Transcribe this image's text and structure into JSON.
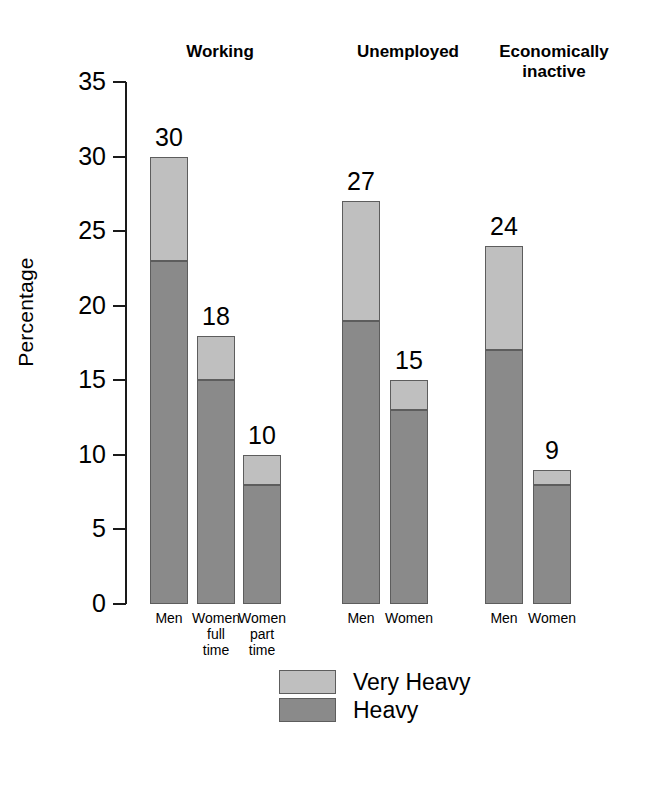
{
  "chart_data": {
    "type": "bar",
    "subtype": "stacked-bar-grouped",
    "title": "",
    "xlabel": "",
    "ylabel": "Percentage",
    "ylim": [
      0,
      35
    ],
    "yticks": [
      0,
      5,
      10,
      15,
      20,
      25,
      30,
      35
    ],
    "ytick_labels": [
      "0",
      "5",
      "10",
      "15",
      "20",
      "25",
      "30",
      "35"
    ],
    "grid": false,
    "legend_position": "bottom-center",
    "legend": [
      "Very Heavy",
      "Heavy"
    ],
    "series": [
      {
        "name": "Heavy",
        "color": "#8a8a8a",
        "values": [
          23,
          15,
          8,
          19,
          13,
          17,
          8
        ]
      },
      {
        "name": "Very Heavy",
        "color": "#bfbfbf",
        "values": [
          7,
          3,
          2,
          8,
          2,
          7,
          1
        ]
      }
    ],
    "categories": [
      "Men",
      "Women full time",
      "Women part time",
      "Men",
      "Women",
      "Men",
      "Women"
    ],
    "totals": [
      30,
      18,
      10,
      27,
      15,
      24,
      9
    ],
    "groups": [
      {
        "label": "Working",
        "categories": [
          "Men",
          "Women\nfull\ntime",
          "Women\npart\ntime"
        ]
      },
      {
        "label": "Unemployed",
        "categories": [
          "Men",
          "Women"
        ]
      },
      {
        "label": "Economically\ninactive",
        "categories": [
          "Men",
          "Women"
        ]
      }
    ]
  },
  "bars": [
    {
      "group": "Working",
      "category": "Men",
      "label": "Men",
      "total": 30,
      "heavy": 23,
      "very_heavy": 7,
      "x": 150
    },
    {
      "group": "Working",
      "category": "Women full time",
      "label": "Women\nfull\ntime",
      "total": 18,
      "heavy": 15,
      "very_heavy": 3,
      "x": 197
    },
    {
      "group": "Working",
      "category": "Women part time",
      "label": "Women\npart\ntime",
      "total": 10,
      "heavy": 8,
      "very_heavy": 2,
      "x": 243
    },
    {
      "group": "Unemployed",
      "category": "Men",
      "label": "Men",
      "total": 27,
      "heavy": 19,
      "very_heavy": 8,
      "x": 342
    },
    {
      "group": "Unemployed",
      "category": "Women",
      "label": "Women",
      "total": 15,
      "heavy": 13,
      "very_heavy": 2,
      "x": 390
    },
    {
      "group": "Economically inactive",
      "category": "Men",
      "label": "Men",
      "total": 24,
      "heavy": 17,
      "very_heavy": 7,
      "x": 485
    },
    {
      "group": "Economically inactive",
      "category": "Women",
      "label": "Women",
      "total": 9,
      "heavy": 8,
      "very_heavy": 1,
      "x": 533
    }
  ],
  "group_headers": [
    {
      "text": "Working",
      "x": 150,
      "width": 140
    },
    {
      "text": "Unemployed",
      "x": 333,
      "width": 150
    },
    {
      "text": "Economically\ninactive",
      "x": 474,
      "width": 160
    }
  ],
  "legend": {
    "items": [
      {
        "label": "Very Heavy",
        "color": "#bfbfbf"
      },
      {
        "label": "Heavy",
        "color": "#8a8a8a"
      }
    ]
  },
  "axis": {
    "y_title": "Percentage",
    "ticks": [
      {
        "value": 35,
        "label": "35"
      },
      {
        "value": 30,
        "label": "30"
      },
      {
        "value": 25,
        "label": "25"
      },
      {
        "value": 20,
        "label": "20"
      },
      {
        "value": 15,
        "label": "15"
      },
      {
        "value": 10,
        "label": "10"
      },
      {
        "value": 5,
        "label": "5"
      },
      {
        "value": 0,
        "label": "0"
      }
    ]
  },
  "colors": {
    "very_heavy": "#bfbfbf",
    "heavy": "#8a8a8a",
    "axis": "#1a1a1a",
    "text": "#000000",
    "background": "#ffffff"
  }
}
